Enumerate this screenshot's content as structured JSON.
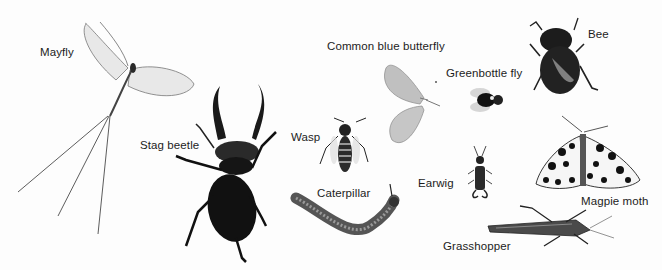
{
  "labels": {
    "mayfly": "Mayfly",
    "stag_beetle": "Stag beetle",
    "wasp": "Wasp",
    "caterpillar": "Caterpillar",
    "common_blue_butterfly": "Common blue butterfly",
    "greenbottle_fly": "Greenbottle fly",
    "bee": "Bee",
    "earwig": "Earwig",
    "magpie_moth": "Magpie moth",
    "grasshopper": "Grasshopper"
  },
  "colors": {
    "ink": "#1a1a1a",
    "wing_light": "#e4e4e4",
    "butterfly_wing": "#bdbdbd",
    "background": "#fdfdfd"
  }
}
